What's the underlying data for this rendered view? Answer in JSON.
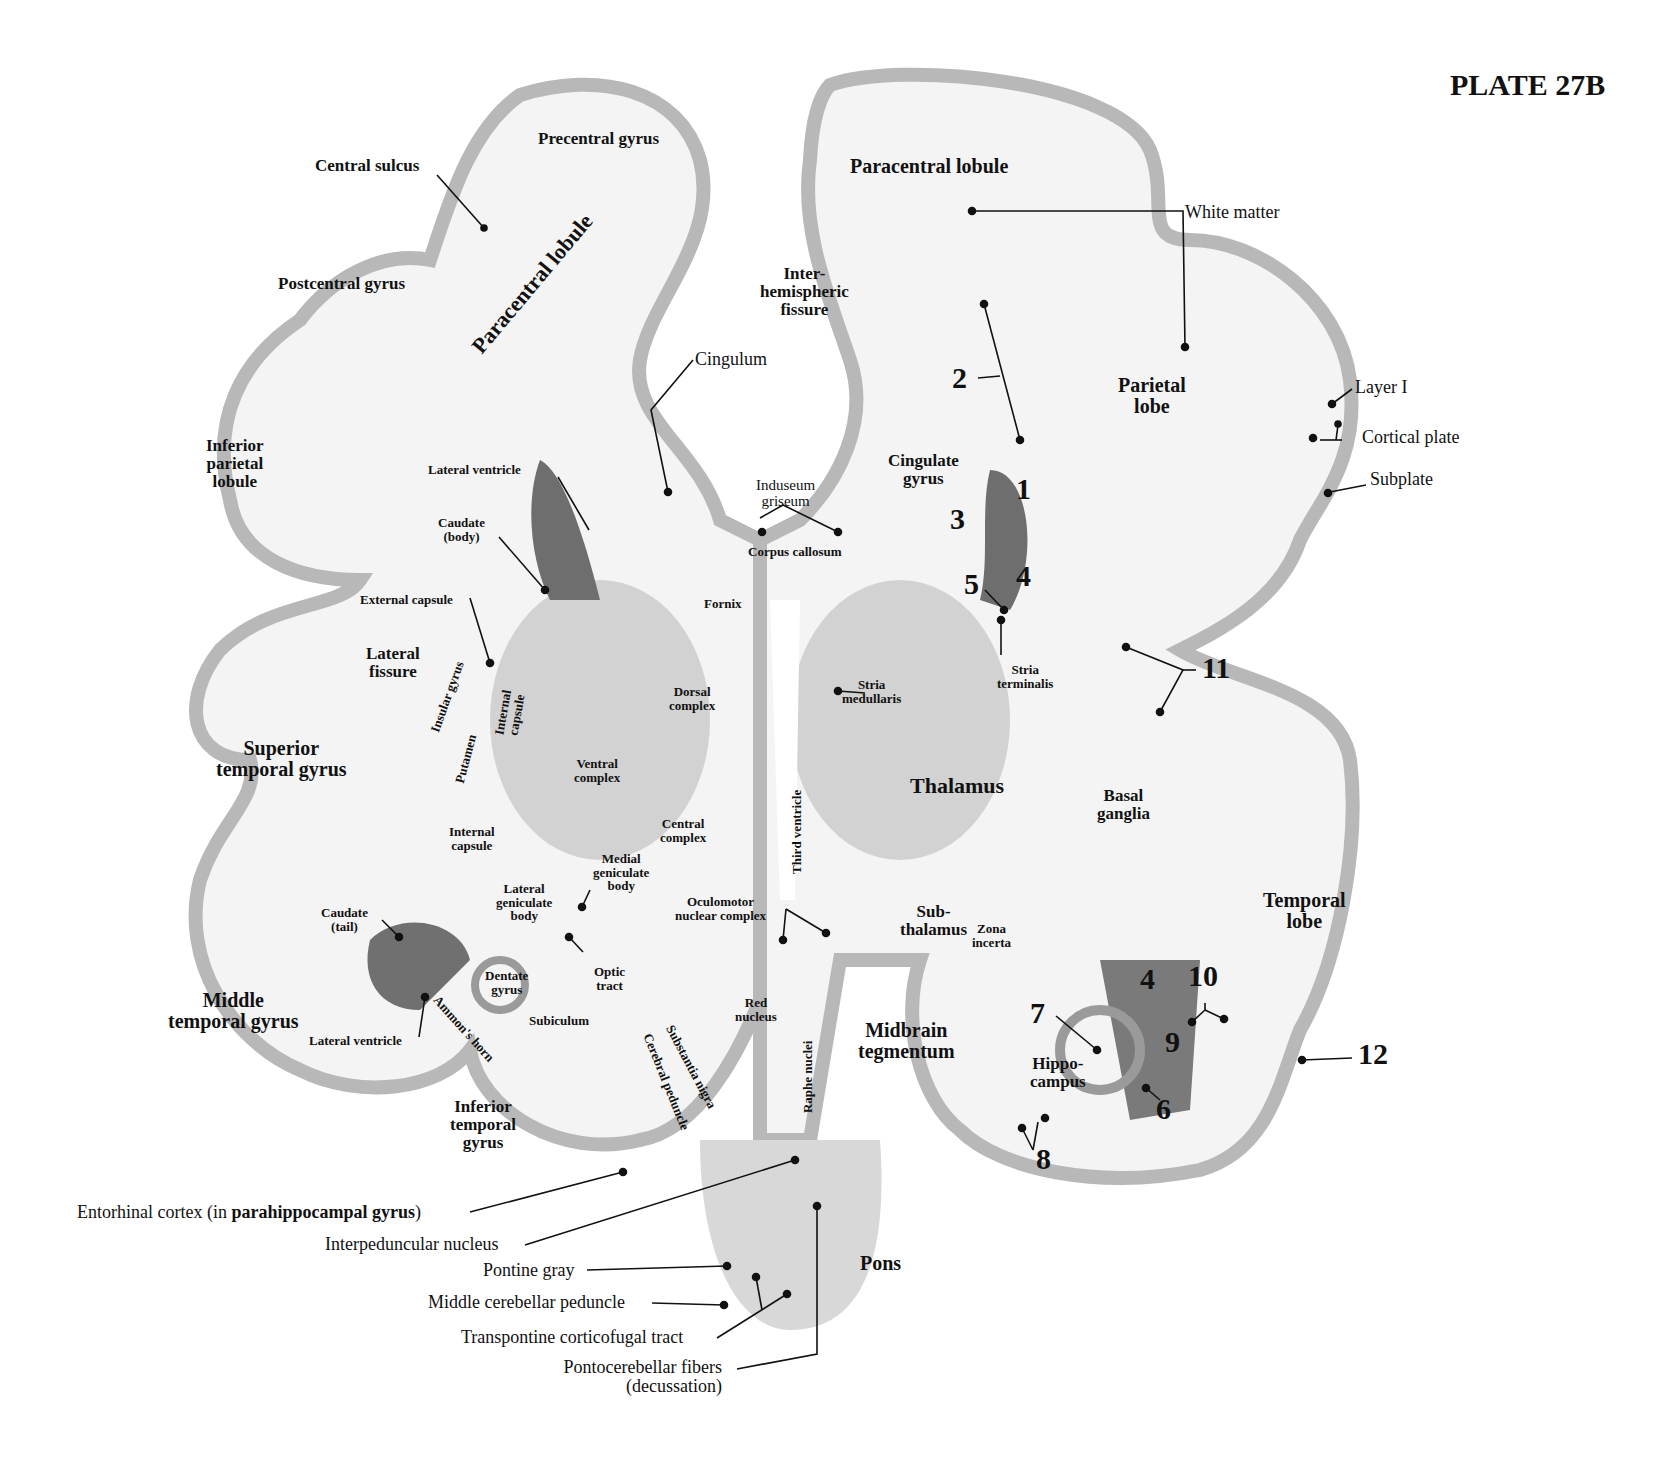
{
  "plate": {
    "title": "PLATE 27B"
  },
  "labels": {
    "central_sulcus": "Central sulcus",
    "precentral_gyrus": "Precentral gyrus",
    "postcentral_gyrus": "Postcentral gyrus",
    "paracentral_lobule_left": "Paracentral lobule",
    "paracentral_lobule_right": "Paracentral lobule",
    "interhemispheric_1": "Inter-",
    "interhemispheric_2": "hemispheric",
    "interhemispheric_3": "fissure",
    "cingulum": "Cingulum",
    "white_matter": "White matter",
    "parietal_lobe_1": "Parietal",
    "parietal_lobe_2": "lobe",
    "layer_i": "Layer I",
    "cortical_plate": "Cortical plate",
    "subplate": "Subplate",
    "inferior_parietal_1": "Inferior",
    "inferior_parietal_2": "parietal",
    "inferior_parietal_3": "lobule",
    "lateral_ventricle_top": "Lateral ventricle",
    "caudate_body_1": "Caudate",
    "caudate_body_2": "(body)",
    "induseum_1": "Induseum",
    "induseum_2": "griseum",
    "corpus_callosum": "Corpus callosum",
    "cingulate_1": "Cingulate",
    "cingulate_2": "gyrus",
    "external_capsule": "External capsule",
    "fornix": "Fornix",
    "lateral_fissure_1": "Lateral",
    "lateral_fissure_2": "fissure",
    "insular_gyrus": "Insular gyrus",
    "internal_capsule_rot_1": "Internal",
    "internal_capsule_rot_2": "capsule",
    "putamen": "Putamen",
    "dorsal_complex_1": "Dorsal",
    "dorsal_complex_2": "complex",
    "stria_medullaris_1": "Stria",
    "stria_medullaris_2": "medullaris",
    "stria_terminalis_1": "Stria",
    "stria_terminalis_2": "terminalis",
    "superior_temporal_1": "Superior",
    "superior_temporal_2": "temporal gyrus",
    "ventral_complex_1": "Ventral",
    "ventral_complex_2": "complex",
    "third_ventricle": "Third ventricle",
    "thalamus": "Thalamus",
    "basal_ganglia_1": "Basal",
    "basal_ganglia_2": "ganglia",
    "internal_capsule_1": "Internal",
    "internal_capsule_2": "capsule",
    "central_complex_1": "Central",
    "central_complex_2": "complex",
    "medial_geniculate_1": "Medial",
    "medial_geniculate_2": "geniculate",
    "medial_geniculate_3": "body",
    "lateral_geniculate_1": "Lateral",
    "lateral_geniculate_2": "geniculate",
    "lateral_geniculate_3": "body",
    "oculomotor_1": "Oculomotor",
    "oculomotor_2": "nuclear complex",
    "subthalamus_1": "Sub-",
    "subthalamus_2": "thalamus",
    "zona_incerta_1": "Zona",
    "zona_incerta_2": "incerta",
    "temporal_lobe_1": "Temporal",
    "temporal_lobe_2": "lobe",
    "caudate_tail_1": "Caudate",
    "caudate_tail_2": "(tail)",
    "optic_tract_1": "Optic",
    "optic_tract_2": "tract",
    "dentate_gyrus_1": "Dentate",
    "dentate_gyrus_2": "gyrus",
    "middle_temporal_1": "Middle",
    "middle_temporal_2": "temporal gyrus",
    "ammons_horn": "Ammon's horn",
    "subiculum": "Subiculum",
    "lateral_ventricle_bottom": "Lateral ventricle",
    "red_nucleus_1": "Red",
    "red_nucleus_2": "nucleus",
    "substantia_nigra": "Substantia nigra",
    "cerebral_peduncle": "Cerebral peduncle",
    "raphe_nuclei": "Raphe nuclei",
    "midbrain_1": "Midbrain",
    "midbrain_2": "tegmentum",
    "hippocampus_1": "Hippo-",
    "hippocampus_2": "campus",
    "inferior_temporal_1": "Inferior",
    "inferior_temporal_2": "temporal",
    "inferior_temporal_3": "gyrus",
    "entorhinal_pre": "Entorhinal cortex (in ",
    "entorhinal_bold": "parahippocampal gyrus",
    "entorhinal_post": ")",
    "interpeduncular": "Interpeduncular nucleus",
    "pontine_gray": "Pontine gray",
    "middle_cerebellar": "Middle cerebellar peduncle",
    "transpontine": "Transpontine corticofugal tract",
    "pontocerebellar_1": "Pontocerebellar fibers",
    "pontocerebellar_2": "(decussation)",
    "pons": "Pons"
  },
  "numbers": {
    "n1": "1",
    "n2": "2",
    "n3": "3",
    "n4a": "4",
    "n5": "5",
    "n4b": "4",
    "n6": "6",
    "n7": "7",
    "n8": "8",
    "n9": "9",
    "n10": "10",
    "n11": "11",
    "n12": "12"
  },
  "colors": {
    "tissue_light": "#e6e6e6",
    "tissue_mid": "#c4c4c4",
    "tissue_dark": "#8a8a8a",
    "ventricle_dark": "#6e6e6e",
    "ink": "#111111"
  }
}
